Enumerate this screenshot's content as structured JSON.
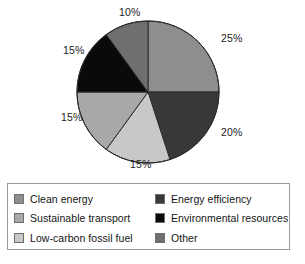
{
  "chart_data": {
    "type": "pie",
    "title": "",
    "subtitle": "",
    "xlabel": "",
    "ylabel": "",
    "legend_position": "bottom",
    "grid": false,
    "data_labels_suffix": "%",
    "start_angle_deg": 0,
    "direction": "clockwise",
    "categories": [
      "Clean energy",
      "Energy efficiency",
      "Low-carbon fossil fuel",
      "Sustainable transport",
      "Environmental resources",
      "Other"
    ],
    "values": [
      25,
      20,
      15,
      15,
      15,
      10
    ],
    "labels": [
      "25%",
      "20%",
      "15%",
      "15%",
      "15%",
      "10%"
    ],
    "colors": [
      "#8e8e8e",
      "#383838",
      "#c8c8c8",
      "#a8a8a8",
      "#0a0a0a",
      "#6f6f6f"
    ],
    "slices": [
      {
        "label": "Clean energy",
        "value": 25,
        "display": "25%",
        "color": "#8e8e8e",
        "start_deg": 0,
        "end_deg": 90
      },
      {
        "label": "Energy efficiency",
        "value": 20,
        "display": "20%",
        "color": "#383838",
        "start_deg": 90,
        "end_deg": 162
      },
      {
        "label": "Low-carbon fossil fuel",
        "value": 15,
        "display": "15%",
        "color": "#c8c8c8",
        "start_deg": 162,
        "end_deg": 216
      },
      {
        "label": "Sustainable transport",
        "value": 15,
        "display": "15%",
        "color": "#a8a8a8",
        "start_deg": 216,
        "end_deg": 270
      },
      {
        "label": "Environmental resources",
        "value": 15,
        "display": "15%",
        "color": "#0a0a0a",
        "start_deg": 270,
        "end_deg": 324
      },
      {
        "label": "Other",
        "value": 10,
        "display": "10%",
        "color": "#6f6f6f",
        "start_deg": 324,
        "end_deg": 360
      }
    ]
  },
  "pie": {
    "labels": {
      "clean_energy_pct": "25%",
      "energy_efficiency_pct": "20%",
      "low_carbon_fossil_fuel_pct": "15%",
      "sustainable_transport_pct": "15%",
      "environmental_resources_pct": "15%",
      "other_pct": "10%"
    }
  },
  "legend": {
    "left_column": [
      {
        "label": "Clean energy",
        "color": "#8e8e8e"
      },
      {
        "label": "Sustainable transport",
        "color": "#a8a8a8"
      },
      {
        "label": "Low-carbon fossil fuel",
        "color": "#c8c8c8"
      }
    ],
    "right_column": [
      {
        "label": "Energy efficiency",
        "color": "#383838"
      },
      {
        "label": "Environmental resources",
        "color": "#0a0a0a"
      },
      {
        "label": "Other",
        "color": "#6f6f6f"
      }
    ],
    "border_color": "#9a9a9a"
  },
  "geometry": {
    "center_x": 148,
    "center_y": 92,
    "radius": 71
  }
}
